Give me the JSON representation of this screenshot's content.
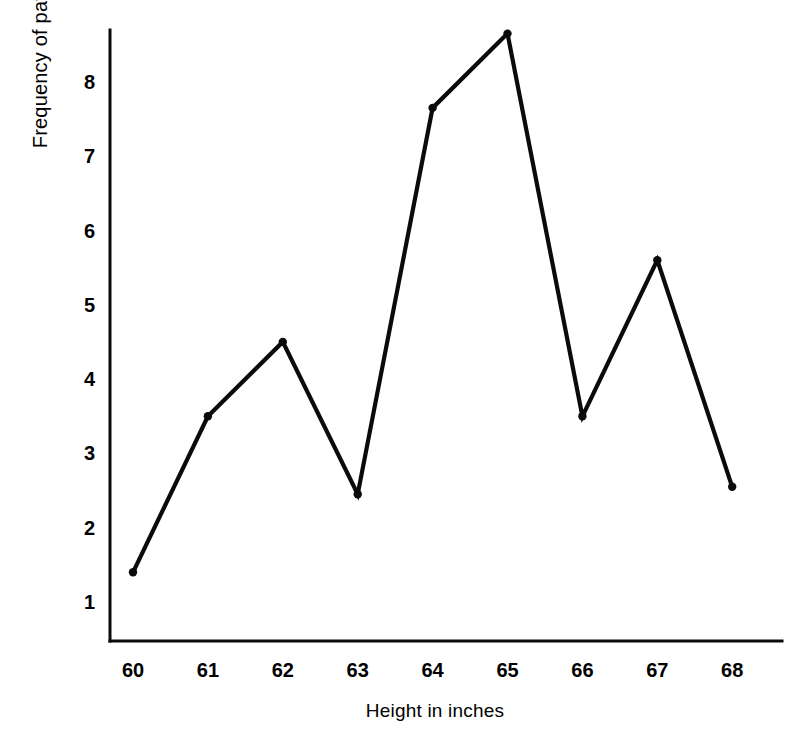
{
  "chart_data": {
    "type": "line",
    "title": "",
    "xlabel": "Height in inches",
    "ylabel": "Frequency of patients",
    "x": [
      60,
      61,
      62,
      63,
      64,
      65,
      66,
      67,
      68
    ],
    "values": [
      1.4,
      3.5,
      4.5,
      2.45,
      7.65,
      8.65,
      3.5,
      5.6,
      2.55
    ],
    "xticklabels": [
      "60",
      "61",
      "62",
      "63",
      "64",
      "65",
      "66",
      "67",
      "68"
    ],
    "yticklabels": [
      "1",
      "2",
      "3",
      "4",
      "5",
      "6",
      "7",
      "8"
    ],
    "yticks": [
      1,
      2,
      3,
      4,
      5,
      6,
      7,
      8
    ],
    "xlim": [
      59.7,
      68.6
    ],
    "ylim": [
      0.45,
      8.95
    ],
    "grid": false,
    "legend": false,
    "markers": "round-dot",
    "line_color": "#0b0b0b",
    "marker_color": "#0b0b0b",
    "background_color": "#ffffff"
  },
  "axes": {
    "x_axis_label": "Height in inches",
    "y_axis_label": "Frequency of patients"
  }
}
